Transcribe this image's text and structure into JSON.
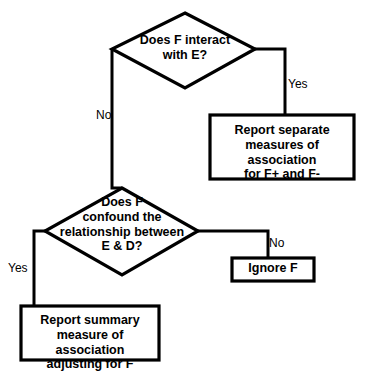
{
  "diagram": {
    "background_color": "#ffffff",
    "line_color": "#000000",
    "nodes": {
      "decision_interact": {
        "shape": "diamond",
        "text": "Does F interact\nwith E?"
      },
      "decision_confound": {
        "shape": "diamond",
        "text": "Does F\nconfound the\nrelationship between\nE & D?"
      },
      "report_separate": {
        "shape": "rectangle",
        "text": "Report separate\nmeasures of association\nfor F+ and F-"
      },
      "ignore_f": {
        "shape": "rectangle",
        "text": "Ignore F"
      },
      "report_summary": {
        "shape": "rectangle",
        "text": "Report summary\nmeasure of association\nadjusting for F"
      }
    },
    "edges": {
      "interact_yes": {
        "label": "Yes",
        "from": "decision_interact",
        "to": "report_separate"
      },
      "interact_no": {
        "label": "No",
        "from": "decision_interact",
        "to": "decision_confound"
      },
      "confound_no": {
        "label": "No",
        "from": "decision_confound",
        "to": "ignore_f"
      },
      "confound_yes": {
        "label": "Yes",
        "from": "decision_confound",
        "to": "report_summary"
      }
    }
  }
}
